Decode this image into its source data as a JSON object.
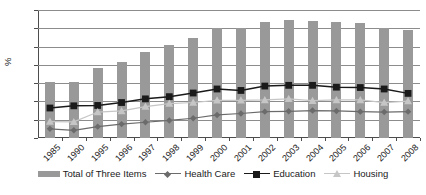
{
  "chart_data": {
    "type": "bar",
    "title": "",
    "subtitle": "",
    "xlabel": "",
    "ylabel": "%",
    "ylim": [
      0,
      35
    ],
    "yticks": [
      0,
      5,
      10,
      15,
      20,
      25,
      30,
      35
    ],
    "grid": true,
    "legend_position": "bottom",
    "categories": [
      "1985",
      "1990",
      "1995",
      "1996",
      "1997",
      "1998",
      "1999",
      "2000",
      "2001",
      "2002",
      "2003",
      "2004",
      "2005",
      "2006",
      "2007",
      "2008"
    ],
    "series": [
      {
        "name": "Total of Three Items",
        "kind": "bar",
        "color": "#999999",
        "marker": "none",
        "values": [
          15.2,
          15.3,
          19.1,
          20.9,
          23.6,
          25.5,
          27.4,
          30.0,
          30.0,
          31.8,
          32.4,
          32.1,
          31.7,
          31.4,
          30.2,
          29.5
        ]
      },
      {
        "name": "Health Care",
        "kind": "line",
        "color": "#6b6b6b",
        "marker": "diamond",
        "values": [
          2.5,
          2.1,
          3.1,
          3.8,
          4.3,
          4.8,
          5.4,
          6.3,
          6.7,
          7.2,
          7.3,
          7.5,
          7.4,
          7.2,
          7.1,
          7.2
        ]
      },
      {
        "name": "Education",
        "kind": "line",
        "color": "#1a1a1a",
        "marker": "square",
        "values": [
          8.2,
          8.8,
          8.9,
          9.7,
          10.7,
          11.3,
          12.3,
          13.4,
          13.0,
          14.2,
          14.4,
          14.4,
          13.9,
          13.8,
          13.4,
          12.2
        ]
      },
      {
        "name": "Housing",
        "kind": "line",
        "color": "#c6c6c6",
        "marker": "triangle",
        "values": [
          4.5,
          4.4,
          7.1,
          7.4,
          8.6,
          9.4,
          9.7,
          10.3,
          10.3,
          10.4,
          10.7,
          10.2,
          10.4,
          10.4,
          9.7,
          10.1
        ]
      }
    ]
  },
  "axis": {
    "y_unit_label": "%",
    "y_tick_labels": [
      "0",
      "5",
      "10",
      "15",
      "20",
      "25",
      "30",
      "35"
    ],
    "x_tick_labels": [
      "1985",
      "1990",
      "1995",
      "1996",
      "1997",
      "1998",
      "1999",
      "2000",
      "2001",
      "2002",
      "2003",
      "2004",
      "2005",
      "2006",
      "2007",
      "2008"
    ]
  },
  "legend": {
    "items": [
      {
        "label": "Total of Three Items",
        "style": "bar",
        "color": "#999999",
        "marker": "none"
      },
      {
        "label": "Health Care",
        "style": "line",
        "color": "#6b6b6b",
        "marker": "diamond"
      },
      {
        "label": "Education",
        "style": "line",
        "color": "#1a1a1a",
        "marker": "square"
      },
      {
        "label": "Housing",
        "style": "line",
        "color": "#c6c6c6",
        "marker": "triangle"
      }
    ]
  },
  "colors": {
    "bar": "#999999",
    "health_care": "#6b6b6b",
    "education": "#1a1a1a",
    "housing": "#c6c6c6",
    "grid": "#8c8c8c",
    "axis": "#4d4d4d",
    "background": "#ffffff"
  }
}
